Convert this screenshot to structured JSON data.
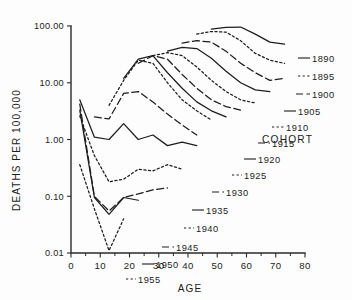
{
  "figure": {
    "background": "#fdfdfd",
    "ink_color": "#1d1d1d"
  },
  "legend": {
    "title": "COHORT",
    "x": 262,
    "y": 143
  },
  "chart_data": {
    "type": "line",
    "title": "",
    "xlabel": "AGE",
    "ylabel": "DEATHS PER 100,000",
    "xlim": [
      0,
      80
    ],
    "ylim": [
      0.01,
      100.0
    ],
    "yscale": "log",
    "grid": false,
    "legend_position": "right-of-curve-ends",
    "x_ticks": [
      0,
      10,
      20,
      30,
      40,
      50,
      60,
      70,
      80
    ],
    "x_tick_labels": [
      "0",
      "10",
      "20",
      "30",
      "40",
      "50",
      "60",
      "70",
      "80"
    ],
    "x_minor_ticks": [
      5,
      15,
      25,
      35,
      45,
      55,
      65,
      75
    ],
    "y_ticks": [
      0.01,
      0.1,
      1.0,
      10.0,
      100.0
    ],
    "y_tick_labels": [
      "0.01",
      "0.10",
      "1.00",
      "10.00",
      "100.00"
    ],
    "series": [
      {
        "name": "1890",
        "style": "solid",
        "label_x": 312,
        "label_y": 62,
        "leader": [
          [
            298,
            58
          ],
          [
            310,
            58
          ]
        ],
        "x": [
          48,
          53,
          58,
          63,
          68,
          73
        ],
        "values": [
          88.0,
          95.0,
          96.0,
          72.0,
          52.0,
          48.0
        ]
      },
      {
        "name": "1895",
        "style": "dotted",
        "label_x": 312,
        "label_y": 80,
        "leader": [
          [
            298,
            76
          ],
          [
            310,
            76
          ]
        ],
        "x": [
          43,
          48,
          53,
          58,
          63,
          68,
          73
        ],
        "values": [
          72.0,
          80.0,
          78.0,
          55.0,
          33.0,
          25.0,
          22.0
        ]
      },
      {
        "name": "1900",
        "style": "dashed",
        "label_x": 312,
        "label_y": 98,
        "leader": [
          [
            296,
            94
          ],
          [
            310,
            94
          ]
        ],
        "x": [
          38,
          43,
          48,
          53,
          58,
          63,
          68,
          73
        ],
        "values": [
          50.0,
          55.0,
          52.0,
          36.0,
          22.0,
          15.0,
          11.0,
          12.0
        ]
      },
      {
        "name": "1905",
        "style": "solid",
        "label_x": 298,
        "label_y": 115,
        "leader": [
          [
            284,
            111
          ],
          [
            296,
            111
          ]
        ],
        "x": [
          33,
          38,
          43,
          48,
          53,
          58,
          63,
          68
        ],
        "values": [
          36.0,
          42.0,
          40.0,
          27.0,
          16.0,
          10.0,
          7.5,
          7.0
        ]
      },
      {
        "name": "1910",
        "style": "dotted",
        "label_x": 286,
        "label_y": 131,
        "leader": [
          [
            272,
            127
          ],
          [
            284,
            127
          ]
        ],
        "x": [
          28,
          33,
          38,
          43,
          48,
          53,
          58,
          63
        ],
        "values": [
          30.0,
          34.0,
          30.0,
          19.0,
          11.0,
          7.0,
          5.0,
          4.4
        ]
      },
      {
        "name": "1915",
        "style": "dashed",
        "label_x": 272,
        "label_y": 147,
        "leader": [
          [
            258,
            143
          ],
          [
            270,
            143
          ]
        ],
        "x": [
          23,
          28,
          33,
          38,
          43,
          48,
          53,
          58
        ],
        "values": [
          22.0,
          30.0,
          26.0,
          14.0,
          8.0,
          5.0,
          3.8,
          3.3
        ]
      },
      {
        "name": "1920",
        "style": "solid",
        "label_x": 258,
        "label_y": 163,
        "leader": [
          [
            244,
            159
          ],
          [
            256,
            159
          ]
        ],
        "x": [
          18,
          23,
          28,
          33,
          38,
          43,
          48,
          53
        ],
        "values": [
          12.0,
          26.0,
          30.0,
          15.0,
          8.0,
          4.6,
          3.2,
          2.5
        ]
      },
      {
        "name": "1925",
        "style": "dotted",
        "label_x": 244,
        "label_y": 179,
        "leader": [
          [
            232,
            175
          ],
          [
            242,
            175
          ]
        ],
        "x": [
          13,
          18,
          23,
          28,
          33,
          38,
          43,
          48
        ],
        "values": [
          4.0,
          11.0,
          25.0,
          22.0,
          10.0,
          5.0,
          3.2,
          2.2
        ]
      },
      {
        "name": "1930",
        "style": "dashed",
        "label_x": 226,
        "label_y": 196,
        "leader": [
          [
            212,
            192
          ],
          [
            224,
            192
          ]
        ],
        "x": [
          8,
          13,
          18,
          23,
          28,
          33,
          38,
          43
        ],
        "values": [
          2.5,
          2.3,
          6.5,
          7.0,
          4.6,
          2.8,
          1.8,
          1.2
        ]
      },
      {
        "name": "1935",
        "style": "solid",
        "label_x": 206,
        "label_y": 214,
        "leader": [
          [
            192,
            210
          ],
          [
            204,
            210
          ]
        ],
        "x": [
          3,
          8,
          13,
          18,
          23,
          28,
          33,
          38,
          43
        ],
        "values": [
          5.0,
          1.1,
          1.0,
          1.9,
          1.0,
          1.2,
          0.78,
          0.9,
          0.78
        ]
      },
      {
        "name": "1940",
        "style": "dotted",
        "label_x": 196,
        "label_y": 232,
        "leader": [
          [
            184,
            228
          ],
          [
            194,
            228
          ]
        ],
        "x": [
          3,
          8,
          13,
          18,
          23,
          28,
          33,
          38
        ],
        "values": [
          2.6,
          0.52,
          0.18,
          0.2,
          0.3,
          0.28,
          0.36,
          0.3
        ]
      },
      {
        "name": "1945",
        "style": "dashed",
        "label_x": 176,
        "label_y": 251,
        "leader": [
          [
            162,
            247
          ],
          [
            174,
            247
          ]
        ],
        "x": [
          3,
          8,
          13,
          18,
          23,
          28,
          33
        ],
        "values": [
          4.2,
          0.1,
          0.055,
          0.095,
          0.11,
          0.13,
          0.14
        ]
      },
      {
        "name": "1950",
        "style": "solid",
        "label_x": 156,
        "label_y": 268,
        "leader": [
          [
            142,
            264
          ],
          [
            154,
            264
          ]
        ],
        "x": [
          3,
          8,
          13,
          18,
          23
        ],
        "values": [
          3.3,
          0.095,
          0.048,
          0.095,
          0.085
        ]
      },
      {
        "name": "1955",
        "style": "dotted",
        "label_x": 138,
        "label_y": 283,
        "leader": [
          [
            126,
            279
          ],
          [
            136,
            279
          ]
        ],
        "x": [
          3,
          8,
          13,
          18
        ],
        "values": [
          0.36,
          0.06,
          0.011,
          0.04
        ]
      }
    ]
  }
}
